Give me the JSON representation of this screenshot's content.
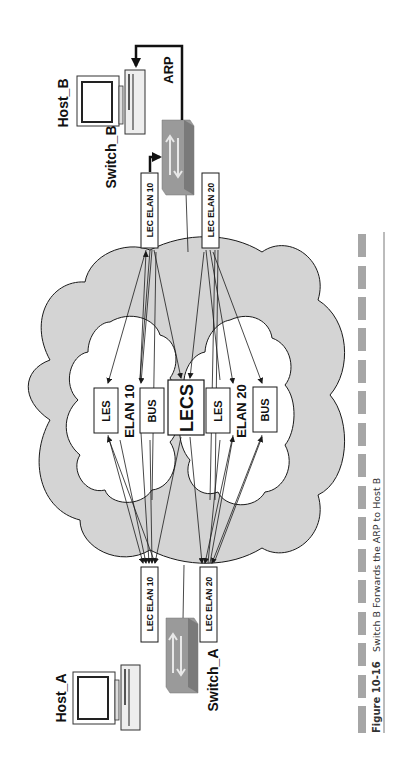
{
  "diagram": {
    "orientation": "rotated-90-ccw",
    "hosts": [
      {
        "id": "host_a",
        "label": "Host_A"
      },
      {
        "id": "host_b",
        "label": "Host_B"
      }
    ],
    "switches": [
      {
        "id": "switch_a",
        "label": "Switch_A"
      },
      {
        "id": "switch_b",
        "label": "Switch_B"
      }
    ],
    "lec_boxes": {
      "switch_b_elan10": "LEC ELAN 10",
      "switch_b_elan20": "LEC ELAN 20",
      "switch_a_elan10": "LEC ELAN 10",
      "switch_a_elan20": "LEC ELAN 20"
    },
    "elans": [
      {
        "name": "ELAN 10",
        "les": "LES",
        "bus": "BUS"
      },
      {
        "name": "ELAN 20",
        "les": "LES",
        "bus": "BUS"
      }
    ],
    "lecs": "LECS",
    "arp_label": "ARP",
    "colors": {
      "cloud_fill": "#d4d4d4",
      "inner_cloud_fill": "#ffffff",
      "switch_fill": "#8c8c8c",
      "caption_bar": "#a6a6a6",
      "stroke": "#1a1a1a"
    }
  },
  "caption": {
    "figure_number": "Figure 10-16",
    "text": "Switch B Forwards the ARP to Host B"
  }
}
